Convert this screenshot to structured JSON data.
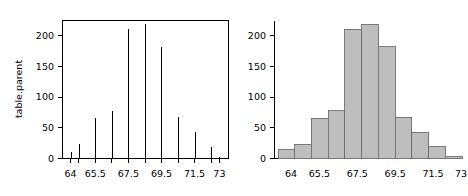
{
  "figure": {
    "title": "",
    "panel_count": 2
  },
  "chart_data": [
    {
      "type": "bar",
      "subtype": "spike",
      "title": "",
      "xlabel": "",
      "ylabel": "table.parent",
      "x": [
        64,
        64.5,
        65.5,
        66.5,
        67.5,
        68.5,
        69.5,
        70.5,
        71.5,
        72.5,
        73
      ],
      "values": [
        10,
        23,
        66,
        78,
        211,
        219,
        182,
        67,
        43,
        19,
        3
      ],
      "xlim": [
        63.5,
        73.5
      ],
      "ylim": [
        0,
        225
      ],
      "xticks": [
        64,
        65.5,
        67.5,
        69.5,
        71.5,
        73
      ],
      "xtick_labels": [
        "64",
        "65.5",
        "67.5",
        "69.5",
        "71.5",
        "73"
      ],
      "yticks": [
        0,
        50,
        100,
        150,
        200
      ],
      "ytick_labels": [
        "0",
        "50",
        "100",
        "150",
        "200"
      ],
      "grid": false,
      "legend": "none",
      "box": true,
      "series_color": "#000000"
    },
    {
      "type": "bar",
      "subtype": "histogram",
      "title": "",
      "xlabel": "",
      "ylabel": "",
      "x": [
        64,
        64.5,
        65.5,
        66.5,
        67.5,
        68.5,
        69.5,
        70.5,
        71.5,
        72.5,
        73
      ],
      "values": [
        14,
        23,
        66,
        78,
        211,
        219,
        182,
        67,
        43,
        19,
        3
      ],
      "xlim": [
        63.5,
        73.5
      ],
      "ylim": [
        0,
        225
      ],
      "xticks": [
        64,
        65.5,
        67.5,
        69.5,
        71.5,
        73
      ],
      "xtick_labels": [
        "64",
        "65.5",
        "67.5",
        "69.5",
        "71.5",
        "73"
      ],
      "yticks": [
        0,
        50,
        100,
        150,
        200
      ],
      "ytick_labels": [
        "0",
        "50",
        "100",
        "150",
        "200"
      ],
      "grid": false,
      "legend": "none",
      "box": false,
      "bar_fill": "#bebebe",
      "bar_border": "#6e6e6e"
    }
  ]
}
